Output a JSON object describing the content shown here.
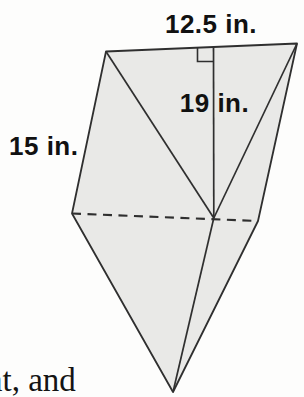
{
  "figure": {
    "labels": {
      "top_edge": "12.5 in.",
      "height": "19 in.",
      "left_edge": "15 in."
    },
    "marks": {
      "right_angle": "right-angle square mark at top of altitude",
      "hidden_edge": "dashed line across middle belt of solid"
    },
    "colors": {
      "face_fill": "#e9e9e7",
      "edge_stroke": "#2f2f2f",
      "background": "#fdfdfc",
      "text": "#111111"
    }
  },
  "page_text": {
    "fragment": "nt, and"
  }
}
